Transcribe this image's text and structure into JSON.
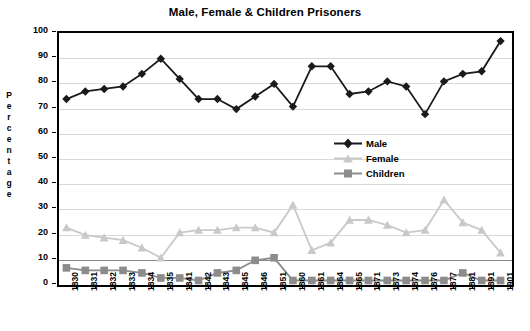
{
  "chart_data": {
    "type": "line",
    "title": "Male, Female & Children Prisoners",
    "xlabel": "",
    "ylabel": "Percentage",
    "ylim": [
      0,
      100
    ],
    "ytick_step": 10,
    "grid": true,
    "legend_position": "inside-right",
    "categories": [
      "1830",
      "1831",
      "1832",
      "1833",
      "1834",
      "1835",
      "1841",
      "1842",
      "1843",
      "1845",
      "1846",
      "1851",
      "1860",
      "1861",
      "1864",
      "1865",
      "1871",
      "1873",
      "1874",
      "1876",
      "1877",
      "1881",
      "1891",
      "1901"
    ],
    "ytick_labels": [
      "0",
      "10",
      "20",
      "30",
      "40",
      "50",
      "60",
      "70",
      "80",
      "90",
      "100"
    ],
    "series": [
      {
        "name": "Male",
        "color": "#1a1a1a",
        "marker": "diamond",
        "values": [
          73,
          76,
          77,
          78,
          83,
          89,
          81,
          73,
          73,
          69,
          74,
          79,
          70,
          86,
          86,
          75,
          76,
          80,
          78,
          67,
          80,
          83,
          84,
          96
        ]
      },
      {
        "name": "Female",
        "color": "#c9c9c9",
        "marker": "triangle",
        "values": [
          22,
          19,
          18,
          17,
          14,
          10,
          20,
          21,
          21,
          22,
          22,
          20,
          31,
          13,
          16,
          25,
          25,
          23,
          20,
          21,
          33,
          24,
          21,
          12
        ]
      },
      {
        "name": "Children",
        "color": "#8c8c8c",
        "marker": "square",
        "values": [
          6,
          5,
          5,
          5,
          4,
          2,
          2,
          1,
          4,
          5,
          9,
          10,
          1,
          1,
          1,
          1,
          1,
          1,
          1,
          1,
          1,
          4,
          1,
          1
        ]
      }
    ]
  },
  "legend": {
    "items": [
      {
        "label": "Male"
      },
      {
        "label": "Female"
      },
      {
        "label": "Children"
      }
    ]
  }
}
